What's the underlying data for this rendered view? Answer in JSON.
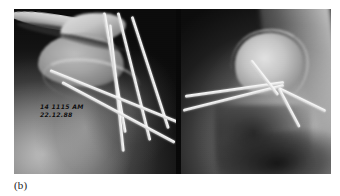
{
  "figure": {
    "caption": "(b)",
    "modality": "radiograph",
    "panel_count": 2
  },
  "overlay": {
    "timestamp_time": "14 1115  AM",
    "timestamp_date": "22.12.88"
  },
  "panels": [
    {
      "id": "left",
      "view_label": "AP shoulder",
      "anatomy": [
        "clavicle",
        "acromion",
        "humeral-head",
        "glenohumeral-joint",
        "humeral-shaft",
        "scapula-blade"
      ],
      "hardware": {
        "type": "k-wire",
        "count": 6,
        "pattern": "crossed-converging",
        "wires": [
          {
            "left": 90,
            "top": 2,
            "length": 122,
            "thickness": 3.1,
            "angle": 80
          },
          {
            "left": 104,
            "top": 2,
            "length": 132,
            "thickness": 3.0,
            "angle": 76
          },
          {
            "left": 118,
            "top": 6,
            "length": 118,
            "thickness": 2.9,
            "angle": 72
          },
          {
            "left": 96,
            "top": 14,
            "length": 128,
            "thickness": 2.8,
            "angle": 84
          },
          {
            "left": 36,
            "top": 60,
            "length": 140,
            "thickness": 2.7,
            "angle": 22
          },
          {
            "left": 48,
            "top": 72,
            "length": 128,
            "thickness": 2.6,
            "angle": 28
          }
        ]
      }
    },
    {
      "id": "right",
      "view_label": "axillary lateral",
      "anatomy": [
        "humeral-head",
        "chest-wall",
        "axilla",
        "soft-tissue"
      ],
      "hardware": {
        "type": "k-wire",
        "count": 5,
        "pattern": "fan-convergent",
        "convergence_point": {
          "x": 98,
          "y": 78
        },
        "wires": [
          {
            "left": 4,
            "top": 86,
            "length": 100,
            "thickness": 2.9,
            "angle": -8
          },
          {
            "left": 2,
            "top": 100,
            "length": 104,
            "thickness": 2.7,
            "angle": -14
          },
          {
            "left": 70,
            "top": 50,
            "length": 44,
            "thickness": 3.0,
            "angle": 52
          },
          {
            "left": 98,
            "top": 78,
            "length": 52,
            "thickness": 2.6,
            "angle": 26
          },
          {
            "left": 98,
            "top": 78,
            "length": 44,
            "thickness": 2.5,
            "angle": 62
          }
        ]
      }
    }
  ],
  "colors": {
    "page_background": "#ffffff",
    "film_background": "#0a0a0a",
    "bone_bright": "#e4e4e4",
    "hardware_metal": "#ffffff",
    "caption_text": "#1a1a1a",
    "overlay_text": "#0d0d0d"
  }
}
